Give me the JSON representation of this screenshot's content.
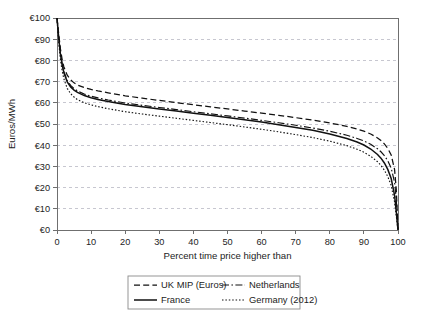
{
  "chart_data": {
    "type": "line",
    "title": "",
    "xlabel": "Percent time price higher than",
    "ylabel": "Euros/MWh",
    "xlim": [
      0,
      100
    ],
    "ylim": [
      0,
      100
    ],
    "grid": "horizontal-dashed",
    "legend_position": "bottom-center",
    "x_ticks": [
      0,
      10,
      20,
      30,
      40,
      50,
      60,
      70,
      80,
      90,
      100
    ],
    "x_tick_labels": [
      "0",
      "10",
      "20",
      "30",
      "40",
      "50",
      "60",
      "70",
      "80",
      "90",
      "100"
    ],
    "y_ticks": [
      0,
      10,
      20,
      30,
      40,
      50,
      60,
      70,
      80,
      90,
      100
    ],
    "y_tick_labels": [
      "€0",
      "€10",
      "€20",
      "€30",
      "€40",
      "€50",
      "€60",
      "€70",
      "€80",
      "€90",
      "€100"
    ],
    "x": [
      0,
      0.5,
      1,
      1.5,
      2,
      3,
      4,
      5,
      6,
      8,
      10,
      12,
      15,
      20,
      25,
      30,
      35,
      40,
      45,
      50,
      55,
      60,
      65,
      70,
      75,
      80,
      85,
      88,
      90,
      92,
      94,
      95,
      96,
      97,
      98,
      99,
      99.5,
      100
    ],
    "series": [
      {
        "name": "UK MIP (Euros)",
        "style": "dashed",
        "color": "#111111",
        "values": [
          100,
          92.5,
          85.5,
          80.5,
          77,
          73,
          70.8,
          69.4,
          68.4,
          67.2,
          66.3,
          65.6,
          64.7,
          63.3,
          62.2,
          61.1,
          60.1,
          59.1,
          58.1,
          57.1,
          56.1,
          55.1,
          54.1,
          53,
          51.8,
          50.5,
          48.9,
          47.6,
          46.6,
          45.3,
          43.4,
          42.2,
          40.6,
          38.5,
          35.4,
          28.5,
          19,
          0
        ]
      },
      {
        "name": "Netherlands",
        "style": "dash-dot",
        "color": "#111111",
        "values": [
          100,
          91,
          83.5,
          78.5,
          74.8,
          70.5,
          68.2,
          66.7,
          65.6,
          64.1,
          63.1,
          62.3,
          61.3,
          59.9,
          58.8,
          57.8,
          56.8,
          55.8,
          54.8,
          53.8,
          52.8,
          51.7,
          50.6,
          49.4,
          48.1,
          46.6,
          44.7,
          43.2,
          42,
          40.4,
          38.3,
          36.9,
          35.1,
          32.7,
          29.2,
          22.5,
          14.5,
          0
        ]
      },
      {
        "name": "France",
        "style": "solid",
        "color": "#111111",
        "values": [
          100,
          90.5,
          83,
          78,
          74.3,
          69.9,
          67.5,
          66,
          64.9,
          63.4,
          62.4,
          61.6,
          60.6,
          59.2,
          58.1,
          57.1,
          56.1,
          55.1,
          54.1,
          53.1,
          52,
          50.9,
          49.7,
          48.4,
          47,
          45.3,
          43.2,
          41.5,
          40.1,
          38.2,
          35.6,
          33.9,
          31.6,
          28.6,
          24.3,
          16.3,
          8.5,
          0
        ]
      },
      {
        "name": "Germany (2012)",
        "style": "dotted",
        "color": "#111111",
        "values": [
          100,
          88.5,
          80.5,
          75.2,
          71.4,
          66.8,
          64.3,
          62.7,
          61.5,
          60,
          59,
          58.2,
          57.2,
          55.8,
          54.7,
          53.7,
          52.7,
          51.7,
          50.7,
          49.7,
          48.6,
          47.5,
          46.3,
          45,
          43.6,
          41.9,
          39.8,
          38.1,
          36.7,
          34.8,
          32.2,
          30.5,
          28.2,
          25.2,
          21,
          13.2,
          6.5,
          0
        ]
      }
    ]
  },
  "legend": {
    "entries": [
      {
        "label": "UK MIP (Euros)",
        "style": "dashed"
      },
      {
        "label": "Netherlands",
        "style": "dash-dot"
      },
      {
        "label": "France",
        "style": "solid"
      },
      {
        "label": "Germany (2012)",
        "style": "dotted"
      }
    ]
  }
}
